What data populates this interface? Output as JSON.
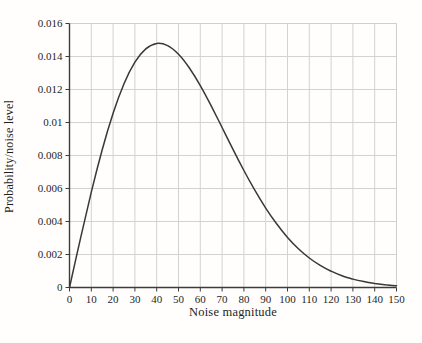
{
  "chart_data": {
    "type": "line",
    "title": "",
    "xlabel": "Noise magnitude",
    "ylabel": "Probability/noise level",
    "xlim": [
      0,
      150
    ],
    "ylim": [
      0,
      0.016
    ],
    "x_ticks": [
      0,
      10,
      20,
      30,
      40,
      50,
      60,
      70,
      80,
      90,
      100,
      110,
      120,
      130,
      140,
      150
    ],
    "y_ticks": [
      0,
      0.002,
      0.004,
      0.006,
      0.008,
      0.01,
      0.012,
      0.014,
      0.016
    ],
    "y_tick_labels": [
      "0",
      "0.002",
      "0.004",
      "0.006",
      "0.008",
      "0.01",
      "0.012",
      "0.014",
      "0.016"
    ],
    "grid": true,
    "legend_position": "none",
    "series": [
      {
        "name": "noise-probability-curve",
        "x": [
          0,
          5,
          10,
          15,
          20,
          25,
          30,
          35,
          40,
          45,
          50,
          55,
          60,
          65,
          70,
          75,
          80,
          85,
          90,
          95,
          100,
          105,
          110,
          115,
          120,
          125,
          130,
          135,
          140,
          145,
          150
        ],
        "y": [
          0,
          0.002952,
          0.005775,
          0.008346,
          0.010563,
          0.012349,
          0.013657,
          0.014463,
          0.014787,
          0.014658,
          0.01414,
          0.013306,
          0.012233,
          0.011004,
          0.009694,
          0.008374,
          0.007091,
          0.005898,
          0.004813,
          0.003859,
          0.003038,
          0.002352,
          0.00179,
          0.001339,
          0.000985,
          0.000713,
          0.000507,
          0.000355,
          0.000245,
          0.000166,
          0.000111
        ]
      }
    ],
    "annotations": []
  },
  "colors": {
    "background": "#fffefd",
    "curve": "#383838",
    "grid": "#d2d2d2",
    "frame": "#cfcfcf",
    "axis": "#3c3c3c",
    "tick": "#3c3c3c",
    "text": "#1f1f1f"
  },
  "layout_values": {
    "plot_left": 69.5,
    "plot_top": 23.5,
    "plot_right": 396.5,
    "plot_bottom": 287.5
  }
}
